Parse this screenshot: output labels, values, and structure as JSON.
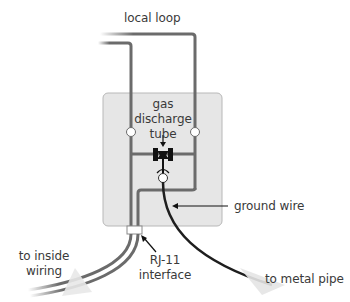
{
  "diagram": {
    "type": "surge-protector-wiring",
    "labels": {
      "local_loop": "local loop",
      "gas_tube_line1": "gas",
      "gas_tube_line2": "discharge",
      "gas_tube_line3": "tube",
      "ground_wire": "ground wire",
      "inside_wiring_line1": "to inside",
      "inside_wiring_line2": "wiring",
      "rj11_line1": "RJ-11",
      "rj11_line2": "interface",
      "metal_pipe": "to metal pipe"
    },
    "colors": {
      "wire": "#6b6b6b",
      "ground_wire": "#1e1e1e",
      "box_fill": "#e6e6e6",
      "box_stroke": "#b5b5b5",
      "terminal": "#ffffff",
      "tube": "#111111",
      "text": "#3a3a3a"
    },
    "components": [
      {
        "name": "protector-box"
      },
      {
        "name": "left-terminal"
      },
      {
        "name": "right-terminal"
      },
      {
        "name": "gas-discharge-tube"
      },
      {
        "name": "ground-terminal"
      },
      {
        "name": "rj11-interface"
      }
    ]
  }
}
